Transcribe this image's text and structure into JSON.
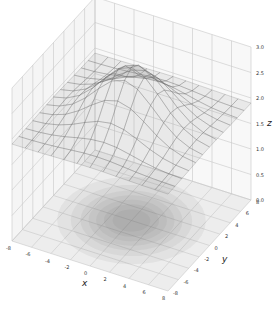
{
  "chart_data": {
    "type": "surface3d",
    "title": "",
    "xlabel": "x",
    "ylabel": "y",
    "zlabel": "z",
    "xlim": [
      -8,
      8
    ],
    "ylim": [
      -8,
      8
    ],
    "zlim": [
      0,
      3
    ],
    "xticks": [
      -8,
      -6,
      -4,
      -2,
      0,
      2,
      4,
      6,
      8
    ],
    "yticks": [
      -8,
      -6,
      -4,
      -2,
      0,
      2,
      4,
      6,
      8
    ],
    "zticks": [
      "0.0",
      "0.5",
      "1.0",
      "1.5",
      "2.0",
      "2.5",
      "3.0"
    ],
    "surface": {
      "description": "Semi-transparent gray wireframe surface: Gaussian bump centered near the origin with peak z ≈ 3.0, decaying to a plane at z ≈ 1.9 at the edges",
      "peak": {
        "x": 0,
        "y": 0,
        "z": 3.0
      },
      "baseline_z": 1.9,
      "sigma": 3.0,
      "grid_lines": 13
    },
    "floor_contour": {
      "description": "Filled gray contour projection on the z=0 floor, darkest at the center",
      "offset_z": 0
    },
    "grid": true,
    "colors": {
      "surface": "#808080",
      "floor_contour": "#555555",
      "pane": "#f2f2f2",
      "grid": "#cccccc"
    }
  }
}
